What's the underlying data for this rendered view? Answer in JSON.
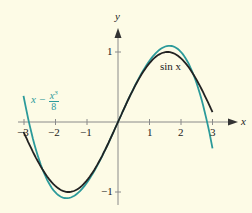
{
  "chart_data": {
    "type": "line",
    "title": "",
    "xlabel": "x",
    "ylabel": "y",
    "xlim": [
      -3.3,
      3.5
    ],
    "ylim": [
      -1.3,
      1.4
    ],
    "x_ticks": [
      "-3",
      "-2",
      "-1",
      "1",
      "2",
      "3"
    ],
    "y_ticks": [
      "1",
      "-1"
    ],
    "grid": false,
    "series": [
      {
        "name": "sin x",
        "function": "sin(x)",
        "domain": [
          -3,
          3
        ],
        "color": "#222222"
      },
      {
        "name": "x - x^3/8",
        "function": "x - x^3/8",
        "domain": [
          -3,
          3
        ],
        "color": "#2b9a9a"
      }
    ],
    "annotations": [
      {
        "text": "sin x",
        "near_series": "sin x"
      },
      {
        "text": "x − x³/8",
        "near_series": "x - x^3/8"
      }
    ]
  },
  "labels": {
    "x_axis": "x",
    "y_axis": "y",
    "x_ticks": [
      "−3",
      "−2",
      "−1",
      "1",
      "2",
      "3"
    ],
    "y_tick_pos": "1",
    "y_tick_neg": "−1",
    "sin_label": "sin x",
    "poly_x": "x − ",
    "poly_num": "x",
    "poly_exp": "3",
    "poly_den": "8"
  },
  "colors": {
    "background": "#fdfbe6",
    "sin": "#222222",
    "poly": "#2b9a9a",
    "axis": "#8a8a8a"
  }
}
